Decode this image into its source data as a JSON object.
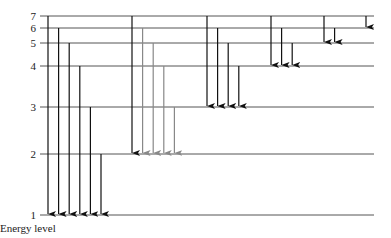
{
  "diagram": {
    "title": "Energy level",
    "levels": [
      {
        "n": 1,
        "label": "1"
      },
      {
        "n": 2,
        "label": "2"
      },
      {
        "n": 3,
        "label": "3"
      },
      {
        "n": 4,
        "label": "4"
      },
      {
        "n": 5,
        "label": "5"
      },
      {
        "n": 6,
        "label": "6"
      },
      {
        "n": 7,
        "label": "7"
      }
    ],
    "series": [
      {
        "name": "Lyman",
        "final": 1,
        "from": [
          7,
          6,
          5,
          4,
          3,
          2
        ],
        "colors": [
          "#111111",
          "#111111",
          "#111111",
          "#111111",
          "#111111",
          "#111111"
        ]
      },
      {
        "name": "Balmer",
        "final": 2,
        "from": [
          7,
          6,
          5,
          4,
          3
        ],
        "colors": [
          "#111111",
          "#888888",
          "#888888",
          "#888888",
          "#888888"
        ]
      },
      {
        "name": "Paschen",
        "final": 3,
        "from": [
          7,
          6,
          5,
          4
        ],
        "colors": [
          "#111111",
          "#111111",
          "#111111",
          "#111111"
        ]
      },
      {
        "name": "Brackett",
        "final": 4,
        "from": [
          7,
          6,
          5
        ],
        "colors": [
          "#111111",
          "#111111",
          "#111111"
        ]
      },
      {
        "name": "Pfund",
        "final": 5,
        "from": [
          7,
          6
        ],
        "colors": [
          "#111111",
          "#111111"
        ]
      },
      {
        "name": "Humphreys",
        "final": 6,
        "from": [
          7
        ],
        "colors": [
          "#111111"
        ]
      }
    ],
    "colors": {
      "level_line": "#555555",
      "arrow": "#111111",
      "arrow_light": "#888888"
    }
  }
}
